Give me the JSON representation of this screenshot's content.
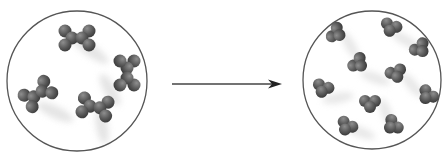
{
  "diagram": {
    "type": "process-transition",
    "colors": {
      "atom": "#5a5a5a",
      "atom_highlight": "#8a8a8a",
      "circle_stroke": "#555555",
      "arrow": "#333333",
      "motion_blur": "#d6d6d6"
    },
    "left_container": {
      "label": "reactant-state",
      "center": [
        77,
        81
      ],
      "radius": 70,
      "molecule_count": 4,
      "molecules": [
        {
          "x": 77,
          "y": 38,
          "angle": 0
        },
        {
          "x": 127,
          "y": 73,
          "angle": 90
        },
        {
          "x": 38,
          "y": 94,
          "angle": -35
        },
        {
          "x": 95,
          "y": 107,
          "angle": 10
        }
      ]
    },
    "arrow": {
      "from": [
        172,
        84
      ],
      "to": [
        282,
        84
      ],
      "direction": "right"
    },
    "right_container": {
      "label": "product-state",
      "center": [
        372,
        80
      ],
      "radius": 69,
      "molecule_count": 10,
      "molecules": [
        {
          "x": 336,
          "y": 33,
          "angle": -60
        },
        {
          "x": 391,
          "y": 27,
          "angle": 20
        },
        {
          "x": 420,
          "y": 48,
          "angle": -40
        },
        {
          "x": 358,
          "y": 63,
          "angle": -50
        },
        {
          "x": 396,
          "y": 73,
          "angle": -20
        },
        {
          "x": 323,
          "y": 88,
          "angle": 20
        },
        {
          "x": 370,
          "y": 103,
          "angle": 0
        },
        {
          "x": 428,
          "y": 95,
          "angle": 40
        },
        {
          "x": 347,
          "y": 126,
          "angle": 30
        },
        {
          "x": 393,
          "y": 125,
          "angle": 50
        }
      ]
    }
  }
}
